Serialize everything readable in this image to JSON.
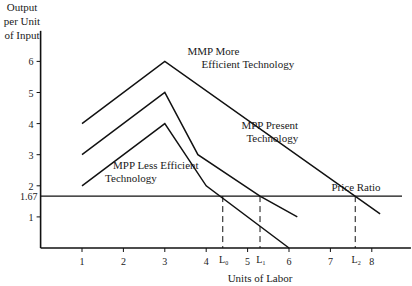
{
  "chart_data": {
    "type": "line",
    "title": "",
    "ylabel_lines": [
      "Output",
      "per Unit",
      "of Input"
    ],
    "xlabel": "Units of Labor",
    "xlim": [
      0,
      8.8
    ],
    "ylim": [
      0,
      6.5
    ],
    "x_ticks": [
      1,
      2,
      3,
      4,
      5,
      6,
      7,
      8
    ],
    "y_ticks": [
      1,
      2,
      3,
      4,
      5,
      6
    ],
    "y_extra_tick": {
      "value": 1.67,
      "label": "1.67"
    },
    "grid": false,
    "series": [
      {
        "name": "MMP More Efficient Technology",
        "label_lines": [
          "MMP More",
          "Efficient Technology"
        ],
        "points": [
          [
            1,
            4
          ],
          [
            3,
            6
          ],
          [
            8.2,
            1.1
          ]
        ]
      },
      {
        "name": "MPP Present Technology",
        "label_lines": [
          "MPP Present",
          "Technology"
        ],
        "points": [
          [
            1,
            3
          ],
          [
            3,
            5
          ],
          [
            3.8,
            3
          ],
          [
            5.3,
            1.67
          ],
          [
            6.2,
            1
          ]
        ]
      },
      {
        "name": "MPP Less Efficient Technology",
        "label_lines": [
          "MPP Less Efficient",
          "Technology"
        ],
        "points": [
          [
            1,
            2
          ],
          [
            3,
            4
          ],
          [
            4,
            2
          ],
          [
            6,
            0
          ]
        ]
      }
    ],
    "reference_line": {
      "name": "Price Ratio",
      "y": 1.67
    },
    "markers": [
      {
        "label": "L₀",
        "x": 4.4
      },
      {
        "label": "L₁",
        "x": 5.3
      },
      {
        "label": "L₂",
        "x": 7.6
      }
    ]
  }
}
